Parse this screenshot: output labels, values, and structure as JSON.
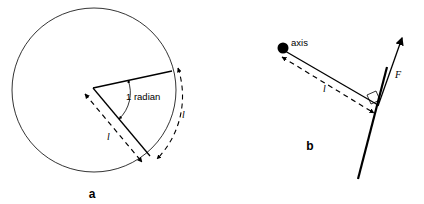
{
  "figure": {
    "background_color": "#ffffff",
    "stroke_color": "#000000",
    "panels": [
      {
        "id": "a",
        "letter": "a",
        "caption_position": {
          "x": 92,
          "y": 196
        },
        "description": "Circle with two radii subtending an angle of 1 radian; arc length equals radius l",
        "labels": {
          "angle": "1 radian",
          "radius": "l",
          "arc": "l"
        },
        "geometry": {
          "circle_center": {
            "x": 94,
            "y": 90
          },
          "circle_radius": 82,
          "vertex": {
            "x": 93,
            "y": 88
          },
          "radius_upper_end": {
            "x": 172,
            "y": 71
          },
          "radius_lower_end": {
            "x": 150,
            "y": 156
          }
        }
      },
      {
        "id": "b",
        "letter": "b",
        "caption_position": {
          "x": 310,
          "y": 148
        },
        "description": "Rod pivoting about an axis with force F applied perpendicular at distance l",
        "labels": {
          "axis": "axis",
          "lever_arm": "l",
          "force": "F"
        },
        "geometry": {
          "axis_point": {
            "x": 272,
            "y": 50
          },
          "force_application_point": {
            "x": 377,
            "y": 108
          },
          "force_arrow_tip": {
            "x": 403,
            "y": 36
          },
          "rod_bottom": {
            "x": 359,
            "y": 178
          },
          "rod_top": {
            "x": 385,
            "y": 74
          }
        }
      }
    ]
  }
}
